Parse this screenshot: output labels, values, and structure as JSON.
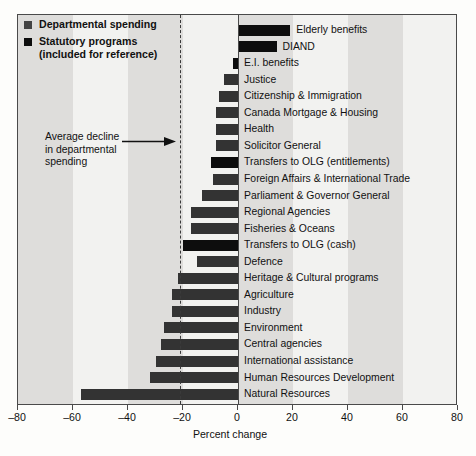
{
  "legend": {
    "items": [
      {
        "label": "Departmental spending",
        "sub": "",
        "color": "#444444",
        "type": "dept"
      },
      {
        "label": "Statutory programs",
        "sub": "(included for reference)",
        "color": "#0d0d0d",
        "type": "stat"
      }
    ]
  },
  "annotation": {
    "line1": "Average decline",
    "line2": "in departmental",
    "line3": "spending",
    "value": -21,
    "arrow_icon": "right-arrow-icon"
  },
  "axis": {
    "ticks": [
      -80,
      -60,
      -40,
      -20,
      0,
      20,
      40,
      60,
      80
    ],
    "tick_labels": [
      "–80",
      "–60",
      "–40",
      "–20",
      "0",
      "20",
      "40",
      "60",
      "80"
    ],
    "xlabel": "Percent change",
    "xmin": -80,
    "xmax": 80
  },
  "chart_data": {
    "type": "bar",
    "orientation": "horizontal",
    "title": "",
    "xlabel": "Percent change",
    "ylabel": "",
    "xlim": [
      -80,
      80
    ],
    "grid": false,
    "legend_position": "top-left",
    "annotations": [
      {
        "text": "Average decline in departmental spending",
        "value": -21,
        "style": "dashed-vertical-line-with-arrow"
      }
    ],
    "series_types": {
      "dept": "Departmental spending",
      "stat": "Statutory programs (included for reference)"
    },
    "categories": [
      "Elderly benefits",
      "DIAND",
      "E.I. benefits",
      "Justice",
      "Citizenship & Immigration",
      "Canada Mortgage & Housing",
      "Health",
      "Solicitor General",
      "Transfers to OLG (entitlements)",
      "Foreign Affairs & International Trade",
      "Parliament & Governor General",
      "Regional Agencies",
      "Fisheries & Oceans",
      "Transfers to OLG (cash)",
      "Defence",
      "Heritage & Cultural programs",
      "Agriculture",
      "Industry",
      "Environment",
      "Central agencies",
      "International assistance",
      "Human Resources Development",
      "Natural Resources",
      "Transport"
    ],
    "values": [
      19,
      14,
      -2,
      -5,
      -7,
      -8,
      -8,
      -8,
      -10,
      -9,
      -13,
      -17,
      -17,
      -20,
      -15,
      -22,
      -24,
      -24,
      -27,
      -28,
      -30,
      -32,
      -57,
      -69
    ],
    "bar_types": [
      "stat",
      "stat",
      "stat",
      "dept",
      "dept",
      "dept",
      "dept",
      "dept",
      "stat",
      "dept",
      "dept",
      "dept",
      "dept",
      "stat",
      "dept",
      "dept",
      "dept",
      "dept",
      "dept",
      "dept",
      "dept",
      "dept",
      "dept",
      "dept"
    ]
  }
}
